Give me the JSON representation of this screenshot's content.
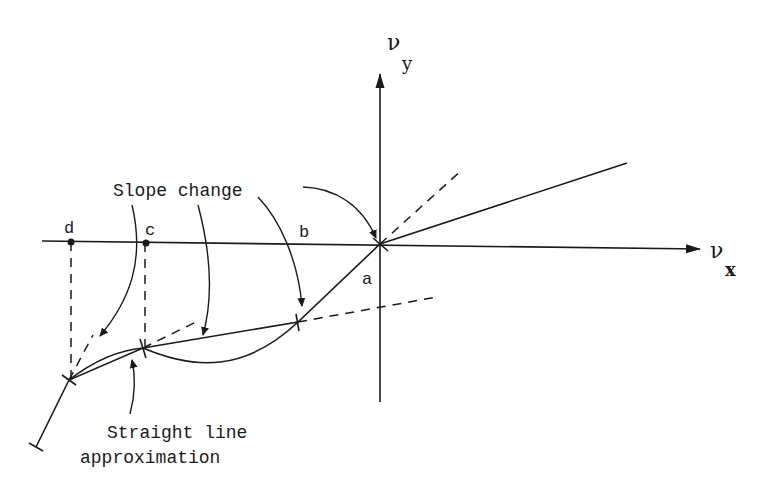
{
  "diagram": {
    "axes": {
      "x_label": "ν",
      "x_subscript": "x",
      "y_label": "ν",
      "y_subscript": "y"
    },
    "points": {
      "a": "a",
      "b": "b",
      "c": "c",
      "d": "d"
    },
    "annotations": {
      "slope_change": "Slope change",
      "straight_line_1": "Straight line",
      "straight_line_2": "approximation"
    },
    "colors": {
      "ink": "#1a1a1a",
      "background": "#ffffff"
    }
  }
}
